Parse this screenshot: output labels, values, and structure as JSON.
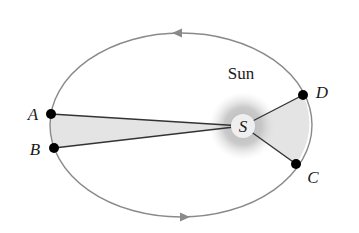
{
  "diagram": {
    "type": "kepler-second-law-orbit",
    "sun_label": "Sun",
    "focus_label": "S",
    "points": [
      {
        "id": "A",
        "label": "A",
        "x": 51,
        "y": 114,
        "label_x": 33,
        "label_y": 120
      },
      {
        "id": "B",
        "label": "B",
        "x": 54,
        "y": 148,
        "label_x": 35,
        "label_y": 155
      },
      {
        "id": "C",
        "label": "C",
        "x": 296,
        "y": 164,
        "label_x": 306,
        "label_y": 183
      },
      {
        "id": "D",
        "label": "D",
        "x": 303,
        "y": 95,
        "label_x": 315,
        "label_y": 98
      }
    ],
    "orbit": {
      "cx": 181,
      "cy": 125,
      "rx": 131,
      "ry": 92,
      "direction": "counterclockwise"
    },
    "sun": {
      "x": 243,
      "y": 126,
      "inner_radius": 12,
      "glow_radius": 32
    },
    "swept_areas": [
      {
        "name": "area-ABS",
        "from": "A",
        "to": "B"
      },
      {
        "name": "area-CDS",
        "from": "C",
        "to": "D"
      }
    ],
    "colors": {
      "orbit": "#8a8a8a",
      "segment": "#333333",
      "area_fill": "#e4e4e4",
      "dot": "#000000",
      "sun_glow": "#bdbdbd",
      "sun_core": "#efefef"
    }
  }
}
